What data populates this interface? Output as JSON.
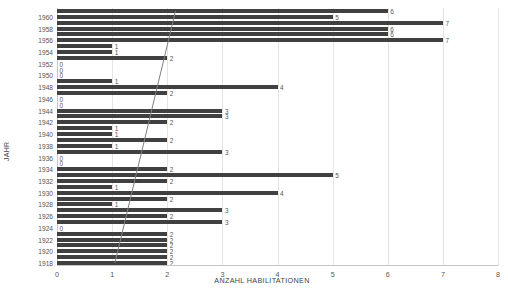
{
  "chart_data": {
    "type": "bar",
    "orientation": "horizontal",
    "title": "",
    "xlabel": "ANZAHL HABILITATIONEN",
    "ylabel": "JAHR",
    "xlim": [
      0,
      8
    ],
    "xticks": [
      0,
      1,
      2,
      3,
      4,
      5,
      6,
      7,
      8
    ],
    "grid": true,
    "legend": false,
    "bar_color": "#404040",
    "grid_color": "#e4e4e4",
    "axis_color": "#c6c6c6",
    "trendline": {
      "visible": true,
      "color": "#808080",
      "x_start": 1.05,
      "y_start": 1918,
      "x_end": 2.15,
      "y_end": 1961
    },
    "ytick_labels": [
      "1960",
      "1958",
      "1956",
      "1954",
      "1952",
      "1950",
      "1948",
      "1946",
      "1944",
      "1942",
      "1940",
      "1938",
      "1936",
      "1934",
      "1932",
      "1930",
      "1928",
      "1926",
      "1924",
      "1922",
      "1920",
      "1918"
    ],
    "categories": [
      1961,
      1960,
      1959,
      1958,
      1957,
      1956,
      1955,
      1954,
      1953,
      1952,
      1951,
      1950,
      1949,
      1948,
      1947,
      1946,
      1945,
      1944,
      1943,
      1942,
      1941,
      1940,
      1939,
      1938,
      1937,
      1936,
      1935,
      1934,
      1933,
      1932,
      1931,
      1930,
      1929,
      1928,
      1927,
      1926,
      1925,
      1924,
      1923,
      1922,
      1921,
      1920,
      1919,
      1918
    ],
    "values": [
      6,
      5,
      7,
      6,
      6,
      7,
      1,
      1,
      2,
      0,
      0,
      0,
      1,
      4,
      2,
      0,
      0,
      3,
      3,
      2,
      1,
      1,
      2,
      1,
      3,
      0,
      0,
      2,
      5,
      2,
      1,
      4,
      2,
      1,
      3,
      2,
      3,
      0,
      2,
      2,
      2,
      2,
      2,
      2
    ],
    "rows": [
      {
        "value": 6,
        "label": "6"
      },
      {
        "value": 5,
        "label": "5"
      },
      {
        "value": 7,
        "label": "7"
      },
      {
        "value": 6,
        "label": "6"
      },
      {
        "value": 6,
        "label": "6"
      },
      {
        "value": 7,
        "label": "7"
      },
      {
        "value": 1,
        "label": "1"
      },
      {
        "value": 1,
        "label": "1"
      },
      {
        "value": 2,
        "label": "2"
      },
      {
        "value": 0,
        "label": "0"
      },
      {
        "value": 0,
        "label": "0"
      },
      {
        "value": 0,
        "label": "0"
      },
      {
        "value": 1,
        "label": "1"
      },
      {
        "value": 4,
        "label": "4"
      },
      {
        "value": 2,
        "label": "2"
      },
      {
        "value": 0,
        "label": "0"
      },
      {
        "value": 0,
        "label": "0"
      },
      {
        "value": 3,
        "label": "3"
      },
      {
        "value": 3,
        "label": "3"
      },
      {
        "value": 2,
        "label": "2"
      },
      {
        "value": 1,
        "label": "1"
      },
      {
        "value": 1,
        "label": "1"
      },
      {
        "value": 2,
        "label": "2"
      },
      {
        "value": 1,
        "label": "1"
      },
      {
        "value": 3,
        "label": "3"
      },
      {
        "value": 0,
        "label": "0"
      },
      {
        "value": 0,
        "label": "0"
      },
      {
        "value": 2,
        "label": "2"
      },
      {
        "value": 5,
        "label": "5"
      },
      {
        "value": 2,
        "label": "2"
      },
      {
        "value": 1,
        "label": "1"
      },
      {
        "value": 4,
        "label": "4"
      },
      {
        "value": 2,
        "label": "2"
      },
      {
        "value": 1,
        "label": "1"
      },
      {
        "value": 3,
        "label": "3"
      },
      {
        "value": 2,
        "label": "2"
      },
      {
        "value": 3,
        "label": "3"
      },
      {
        "value": 0,
        "label": "0"
      },
      {
        "value": 2,
        "label": "2"
      },
      {
        "value": 2,
        "label": "2"
      },
      {
        "value": 2,
        "label": "2"
      },
      {
        "value": 2,
        "label": "2"
      },
      {
        "value": 2,
        "label": "2"
      },
      {
        "value": 2,
        "label": "2"
      }
    ]
  }
}
